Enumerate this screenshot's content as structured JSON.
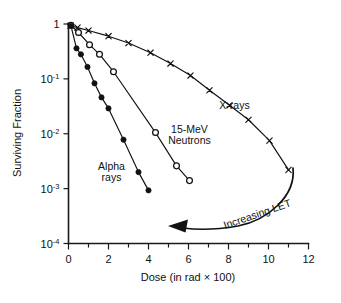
{
  "chart_data": {
    "type": "line",
    "title": "",
    "xlabel": "Dose (in rad × 100)",
    "ylabel": "Surviving Fraction",
    "xlim": [
      0,
      12
    ],
    "ylim": [
      0.0001,
      1
    ],
    "yscale": "log",
    "grid": false,
    "legend_position": "inline-annotations",
    "x_ticks": [
      {
        "value": 0,
        "label": "0",
        "major": true
      },
      {
        "value": 1,
        "label": "",
        "major": false
      },
      {
        "value": 2,
        "label": "2",
        "major": true
      },
      {
        "value": 3,
        "label": "",
        "major": false
      },
      {
        "value": 4,
        "label": "4",
        "major": true
      },
      {
        "value": 5,
        "label": "",
        "major": false
      },
      {
        "value": 6,
        "label": "6",
        "major": true
      },
      {
        "value": 7,
        "label": "",
        "major": false
      },
      {
        "value": 8,
        "label": "8",
        "major": true
      },
      {
        "value": 9,
        "label": "",
        "major": false
      },
      {
        "value": 10,
        "label": "10",
        "major": true
      },
      {
        "value": 11,
        "label": "",
        "major": false
      },
      {
        "value": 12,
        "label": "12",
        "major": true
      }
    ],
    "y_ticks": [
      {
        "value": 1,
        "base": "1",
        "exp": ""
      },
      {
        "value": 0.1,
        "base": "10",
        "exp": "-1"
      },
      {
        "value": 0.01,
        "base": "10",
        "exp": "-2"
      },
      {
        "value": 0.001,
        "base": "10",
        "exp": "-3"
      },
      {
        "value": 0.0001,
        "base": "10",
        "exp": "-4"
      }
    ],
    "series": [
      {
        "name": "X-rays",
        "marker": "cross",
        "label_line1": "X-rays",
        "label_line2": "",
        "label_x": 8.3,
        "label_y": 0.028,
        "points": [
          {
            "x": 0.1,
            "y": 0.93
          },
          {
            "x": 0.45,
            "y": 0.86
          },
          {
            "x": 1.0,
            "y": 0.76
          },
          {
            "x": 2.0,
            "y": 0.6
          },
          {
            "x": 3.0,
            "y": 0.45
          },
          {
            "x": 4.1,
            "y": 0.3
          },
          {
            "x": 5.1,
            "y": 0.19
          },
          {
            "x": 6.1,
            "y": 0.115
          },
          {
            "x": 7.05,
            "y": 0.062
          },
          {
            "x": 8.05,
            "y": 0.033
          },
          {
            "x": 9.0,
            "y": 0.018
          },
          {
            "x": 10.05,
            "y": 0.0075
          },
          {
            "x": 11.0,
            "y": 0.0022
          }
        ]
      },
      {
        "name": "15-MeV Neutrons",
        "marker": "open-circle",
        "label_line1": "15-MeV",
        "label_line2": "Neutrons",
        "label_x": 6.05,
        "label_y": 0.0105,
        "points": [
          {
            "x": 0.12,
            "y": 0.95
          },
          {
            "x": 0.5,
            "y": 0.7
          },
          {
            "x": 1.05,
            "y": 0.42
          },
          {
            "x": 1.55,
            "y": 0.28
          },
          {
            "x": 2.25,
            "y": 0.135
          },
          {
            "x": 4.35,
            "y": 0.0105
          },
          {
            "x": 5.4,
            "y": 0.0026
          },
          {
            "x": 6.05,
            "y": 0.0014
          }
        ]
      },
      {
        "name": "Alpha rays",
        "marker": "filled-circle",
        "label_line1": "Alpha",
        "label_line2": "rays",
        "label_x": 2.15,
        "label_y": 0.0022,
        "points": [
          {
            "x": 0.12,
            "y": 0.93
          },
          {
            "x": 0.4,
            "y": 0.36
          },
          {
            "x": 0.62,
            "y": 0.28
          },
          {
            "x": 0.95,
            "y": 0.165
          },
          {
            "x": 1.3,
            "y": 0.083
          },
          {
            "x": 1.65,
            "y": 0.046
          },
          {
            "x": 2.0,
            "y": 0.029
          },
          {
            "x": 2.75,
            "y": 0.0078
          },
          {
            "x": 3.5,
            "y": 0.002
          },
          {
            "x": 4.0,
            "y": 0.00093
          }
        ]
      }
    ],
    "annotations": [
      {
        "name": "increasing-let",
        "text": "Increasing LET",
        "arrow_from": {
          "x": 11.0,
          "y": 0.0022
        },
        "arrow_to": {
          "x": 5.0,
          "y": 0.00018
        }
      }
    ]
  }
}
